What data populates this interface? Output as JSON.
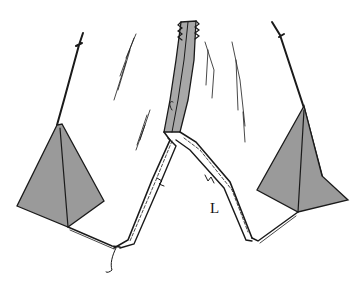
{
  "diagram": {
    "labels": [
      {
        "id": "L",
        "text": "L",
        "x": 210,
        "y": 200
      }
    ],
    "colors": {
      "fill_gray": "#9a9a9a",
      "seam_gray": "#a8a8a8",
      "line": "#1a1a1a",
      "background": "#ffffff"
    }
  }
}
